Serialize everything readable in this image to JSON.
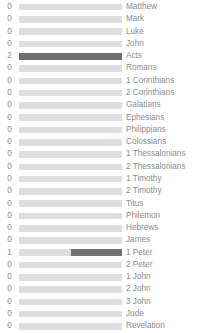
{
  "chart_data": {
    "type": "bar",
    "title": "",
    "subtitle": "",
    "xlabel": "",
    "ylabel": "",
    "orientation": "horizontal",
    "grid": false,
    "legend": null,
    "xlim": [
      0,
      2
    ],
    "value_labels_position": "left",
    "categories": [
      "Matthew",
      "Mark",
      "Luke",
      "John",
      "Acts",
      "Romans",
      "1 Corinthians",
      "2 Corinthians",
      "Galatians",
      "Ephesians",
      "Philippians",
      "Colossians",
      "1 Thessalonians",
      "2 Thessalonians",
      "1 Timothy",
      "2 Timothy",
      "Titus",
      "Philemon",
      "Hebrews",
      "James",
      "1 Peter",
      "2 Peter",
      "1 John",
      "2 John",
      "3 John",
      "Jude",
      "Revelation"
    ],
    "values": [
      0,
      0,
      0,
      0,
      2,
      0,
      0,
      0,
      0,
      0,
      0,
      0,
      0,
      0,
      0,
      0,
      0,
      0,
      0,
      0,
      1,
      0,
      0,
      0,
      0,
      0,
      0
    ]
  },
  "style": {
    "track_color": "#dedede",
    "fill_color": "#6f6f6f",
    "text_color": "#8b8b8b",
    "background": "#ffffff"
  },
  "rows": [
    {
      "value": "0",
      "label": "Matthew",
      "fill_pct": 0
    },
    {
      "value": "0",
      "label": "Mark",
      "fill_pct": 0
    },
    {
      "value": "0",
      "label": "Luke",
      "fill_pct": 0
    },
    {
      "value": "0",
      "label": "John",
      "fill_pct": 0
    },
    {
      "value": "2",
      "label": "Acts",
      "fill_pct": 100
    },
    {
      "value": "0",
      "label": "Romans",
      "fill_pct": 0
    },
    {
      "value": "0",
      "label": "1 Corinthians",
      "fill_pct": 0
    },
    {
      "value": "0",
      "label": "2 Corinthians",
      "fill_pct": 0
    },
    {
      "value": "0",
      "label": "Galatians",
      "fill_pct": 0
    },
    {
      "value": "0",
      "label": "Ephesians",
      "fill_pct": 0
    },
    {
      "value": "0",
      "label": "Philippians",
      "fill_pct": 0
    },
    {
      "value": "0",
      "label": "Colossians",
      "fill_pct": 0
    },
    {
      "value": "0",
      "label": "1 Thessalonians",
      "fill_pct": 0
    },
    {
      "value": "0",
      "label": "2 Thessalonians",
      "fill_pct": 0
    },
    {
      "value": "0",
      "label": "1 Timothy",
      "fill_pct": 0
    },
    {
      "value": "0",
      "label": "2 Timothy",
      "fill_pct": 0
    },
    {
      "value": "0",
      "label": "Titus",
      "fill_pct": 0
    },
    {
      "value": "0",
      "label": "Philemon",
      "fill_pct": 0
    },
    {
      "value": "0",
      "label": "Hebrews",
      "fill_pct": 0
    },
    {
      "value": "0",
      "label": "James",
      "fill_pct": 0
    },
    {
      "value": "1",
      "label": "1 Peter",
      "fill_pct": 50
    },
    {
      "value": "0",
      "label": "2 Peter",
      "fill_pct": 0
    },
    {
      "value": "0",
      "label": "1 John",
      "fill_pct": 0
    },
    {
      "value": "0",
      "label": "2 John",
      "fill_pct": 0
    },
    {
      "value": "0",
      "label": "3 John",
      "fill_pct": 0
    },
    {
      "value": "0",
      "label": "Jude",
      "fill_pct": 0
    },
    {
      "value": "0",
      "label": "Revelation",
      "fill_pct": 0
    }
  ]
}
